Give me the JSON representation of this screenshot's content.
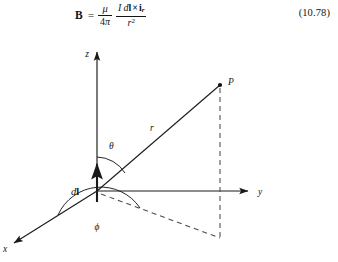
{
  "page": {
    "background_color": "#ffffff",
    "ink_color": "#141414"
  },
  "equation": {
    "lhs": "B",
    "relation": "=",
    "factor1": {
      "numerator": "μ",
      "denominator_digit": "4",
      "denominator_symbol": "π"
    },
    "factor2": {
      "numerator_current": "I",
      "numerator_differential": "d",
      "numerator_vector": "l",
      "numerator_cross": "×",
      "numerator_unit_vector": "i",
      "numerator_unit_subscript": "r",
      "denominator_var": "r",
      "denominator_exponent": "2"
    },
    "number": "(10.78)",
    "plain_text": "B = (μ / 4π) (I dl × i_r) / r²"
  },
  "figure": {
    "caption": "",
    "axes": [
      {
        "id": "z",
        "label": "z",
        "label_x": 87,
        "label_y": 16,
        "direction": "up"
      },
      {
        "id": "y",
        "label": "y",
        "label_x": 258,
        "label_y": 156,
        "direction": "right"
      },
      {
        "id": "x",
        "label": "x",
        "label_x": 5,
        "label_y": 212,
        "direction": "down-left"
      }
    ],
    "origin": {
      "x": 97,
      "y": 153
    },
    "points": [
      {
        "id": "P",
        "label": "P",
        "x": 220,
        "y": 47,
        "label_x": 228,
        "label_y": 45
      },
      {
        "id": "projection",
        "label": "",
        "x": 220,
        "y": 200
      }
    ],
    "segments": [
      {
        "id": "r-vector",
        "label": "r",
        "label_x": 150,
        "label_y": 91,
        "style": "solid"
      },
      {
        "id": "p-drop",
        "label": "",
        "style": "dashed"
      },
      {
        "id": "ground-projection",
        "label": "",
        "style": "dashed"
      },
      {
        "id": "dl-element",
        "label": "dl",
        "label_x": 72,
        "label_y": 155,
        "style": "solid-arrow"
      }
    ],
    "angles": [
      {
        "id": "theta",
        "label": "θ",
        "label_x": 110,
        "label_y": 108,
        "between": "z-axis and r"
      },
      {
        "id": "phi",
        "label": "ϕ",
        "label_x": 99,
        "label_y": 189,
        "between": "x-axis and projection"
      }
    ]
  }
}
